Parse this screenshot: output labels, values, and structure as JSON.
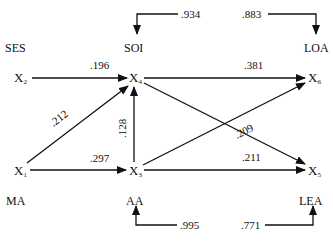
{
  "diagram": {
    "type": "path-diagram",
    "constructs": {
      "ses": "SES",
      "soi": "SOI",
      "loa": "LOA",
      "ma": "MA",
      "aa": "AA",
      "lea": "LEA"
    },
    "nodes": {
      "x1": {
        "base": "X",
        "sub": "1",
        "construct": "MA"
      },
      "x2": {
        "base": "X",
        "sub": "2",
        "construct": "SES"
      },
      "x3": {
        "base": "X",
        "sub": "3",
        "construct": "AA"
      },
      "x4": {
        "base": "X",
        "sub": "4",
        "construct": "SOI"
      },
      "x5": {
        "base": "X",
        "sub": "5",
        "construct": "LEA"
      },
      "x6": {
        "base": "X",
        "sub": "6",
        "construct": "LOA"
      }
    },
    "paths": [
      {
        "from": "X2",
        "to": "X4",
        "coef": ".196"
      },
      {
        "from": "X1",
        "to": "X4",
        "coef": ".212"
      },
      {
        "from": "X1",
        "to": "X3",
        "coef": ".297"
      },
      {
        "from": "X3",
        "to": "X4",
        "coef": ".128"
      },
      {
        "from": "X4",
        "to": "X6",
        "coef": ".381"
      },
      {
        "from": "X3",
        "to": "X6",
        "coef": ".209"
      },
      {
        "from": "X3",
        "to": "X5",
        "coef": ".211"
      },
      {
        "from": "X4",
        "to": "X5",
        "coef": ""
      }
    ],
    "residuals": {
      "soi": ".934",
      "loa": ".883",
      "aa": ".995",
      "lea": ".771"
    }
  }
}
